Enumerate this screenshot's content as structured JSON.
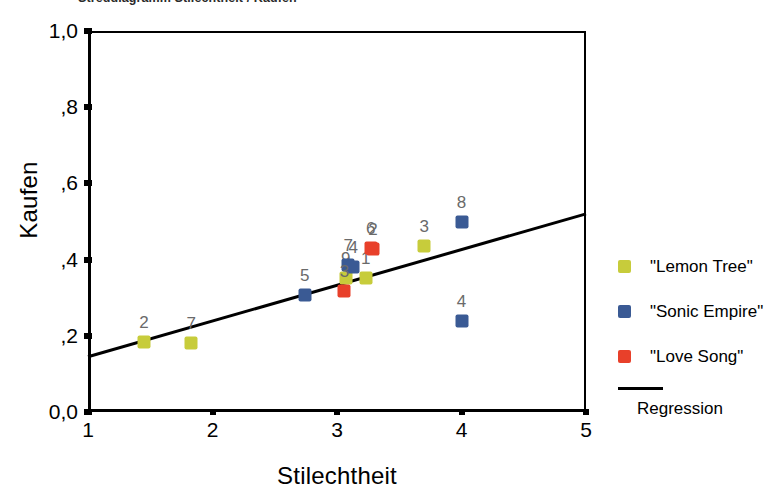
{
  "chart_title": "Streudiagramm Stilechtheit / Kaufen",
  "chart_data": {
    "type": "scatter",
    "title": "Streudiagramm Stilechtheit / Kaufen",
    "xlabel": "Stilechtheit",
    "ylabel": "Kaufen",
    "xlim": [
      1,
      5
    ],
    "ylim": [
      0.0,
      1.0
    ],
    "xticks": [
      "1",
      "2",
      "3",
      "4",
      "5"
    ],
    "xtick_values": [
      1,
      2,
      3,
      4,
      5
    ],
    "yticks": [
      "0,0",
      ",2",
      ",4",
      ",6",
      ",8",
      "1,0"
    ],
    "ytick_values": [
      0.0,
      0.2,
      0.4,
      0.6,
      0.8,
      1.0
    ],
    "grid": false,
    "legend_position": "right",
    "series": [
      {
        "name": "\"Lemon Tree\"",
        "color": "#c7cc3b",
        "points": [
          {
            "label": "2",
            "x": 1.45,
            "y": 0.185
          },
          {
            "label": "7",
            "x": 1.83,
            "y": 0.18
          },
          {
            "label": "9",
            "x": 3.07,
            "y": 0.352
          },
          {
            "label": "1",
            "x": 3.23,
            "y": 0.352
          },
          {
            "label": "3",
            "x": 3.7,
            "y": 0.437
          }
        ]
      },
      {
        "name": "\"Sonic Empire\"",
        "color": "#3a5a94",
        "points": [
          {
            "label": "5",
            "x": 2.74,
            "y": 0.307
          },
          {
            "label": "7",
            "x": 3.09,
            "y": 0.385
          },
          {
            "label": "4",
            "x": 3.13,
            "y": 0.38
          },
          {
            "label": "8",
            "x": 4.0,
            "y": 0.498
          },
          {
            "label": "4",
            "x": 4.0,
            "y": 0.238
          }
        ]
      },
      {
        "name": "\"Love Song\"",
        "color": "#e8402a",
        "points": [
          {
            "label": "3",
            "x": 3.06,
            "y": 0.317
          },
          {
            "label": "6",
            "x": 3.27,
            "y": 0.43
          },
          {
            "label": "2",
            "x": 3.29,
            "y": 0.427
          }
        ]
      }
    ],
    "regression": {
      "label": "Regression",
      "color": "#000000",
      "x_start": 1.0,
      "y_start": 0.145,
      "x_end": 5.0,
      "y_end": 0.52
    }
  },
  "axes": {
    "y_title": "Kaufen",
    "x_title": "Stilechtheit"
  },
  "legend": {
    "items": [
      {
        "label": "\"Lemon Tree\"",
        "color": "#c7cc3b"
      },
      {
        "label": "\"Sonic Empire\"",
        "color": "#3a5a94"
      },
      {
        "label": "\"Love Song\"",
        "color": "#e8402a"
      }
    ],
    "regression_label": "Regression"
  }
}
